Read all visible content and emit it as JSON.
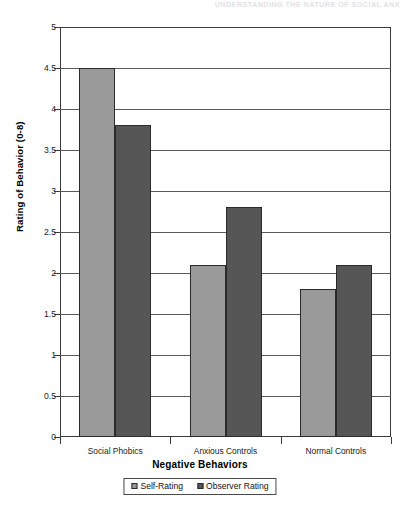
{
  "page_header": "UNDERSTANDING THE NATURE OF SOCIAL ANX",
  "chart_data": {
    "type": "bar",
    "title": "",
    "xlabel": "Negative Behaviors",
    "ylabel": "Rating of Behavior (0-8)",
    "categories": [
      "Social Phobics",
      "Anxious Controls",
      "Normal Controls"
    ],
    "series": [
      {
        "name": "Self-Rating",
        "color": "#9a9a9a",
        "values": [
          4.5,
          2.1,
          1.8
        ]
      },
      {
        "name": "Observer Rating",
        "color": "#565656",
        "values": [
          3.8,
          2.8,
          2.1
        ]
      }
    ],
    "ylim": [
      0,
      5
    ],
    "ytick_step": 0.5,
    "ytick_labels": [
      "5",
      "4.5",
      "4",
      "3.5",
      "3",
      "2.5",
      "2",
      "1.5",
      "1",
      "0.5",
      "0"
    ],
    "ytick_values": [
      5,
      4.5,
      4,
      3.5,
      3,
      2.5,
      2,
      1.5,
      1,
      0.5,
      0
    ],
    "grid": true,
    "legend_position": "bottom"
  },
  "legend": {
    "items": [
      {
        "label": "Self-Rating",
        "color": "#9a9a9a"
      },
      {
        "label": "Observer Rating",
        "color": "#565656"
      }
    ]
  }
}
